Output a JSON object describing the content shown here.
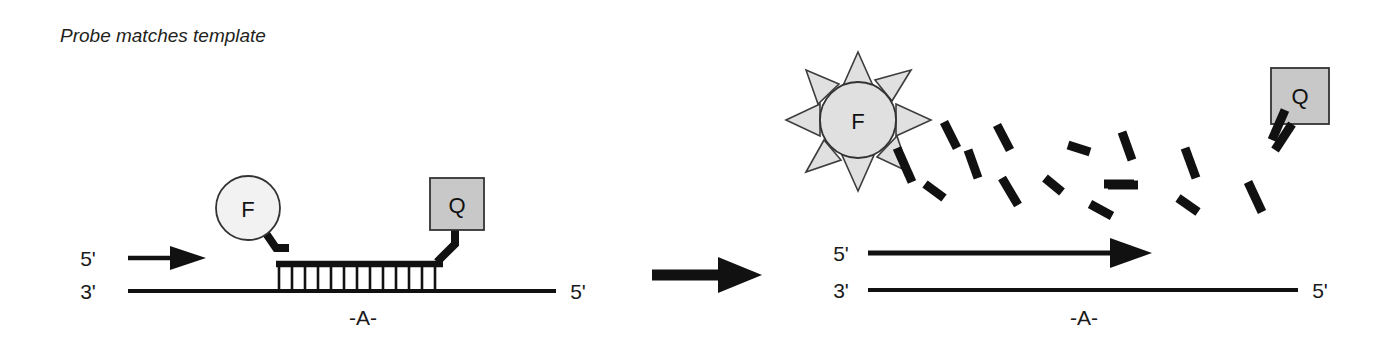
{
  "figure": {
    "caption": "Probe matches template",
    "background_color": "#ffffff",
    "ink_color": "#111111"
  },
  "colors": {
    "fluorophore_fill": "#f2f2f2",
    "quencher_fill": "#c8c8c8",
    "ray_fill": "#e0e0e0",
    "outline": "#333333",
    "text": "#1a1a1a"
  },
  "left_panel": {
    "name": "intact-probe-state",
    "primer_label_5prime": "5'",
    "template_label_3prime": "3'",
    "template_label_5prime": "5'",
    "base_label": "-A-",
    "fluorophore_letter": "F",
    "quencher_letter": "Q",
    "base_pair_count": 13
  },
  "transition": {
    "name": "cleavage-transition-arrow",
    "direction": "right"
  },
  "right_panel": {
    "name": "cleaved-probe-state",
    "primer_label_5prime": "5'",
    "template_label_3prime": "3'",
    "template_label_5prime": "5'",
    "base_label": "-A-",
    "fluorophore_letter": "F",
    "quencher_letter": "Q",
    "ray_count": 8,
    "fragment_count": 16
  }
}
